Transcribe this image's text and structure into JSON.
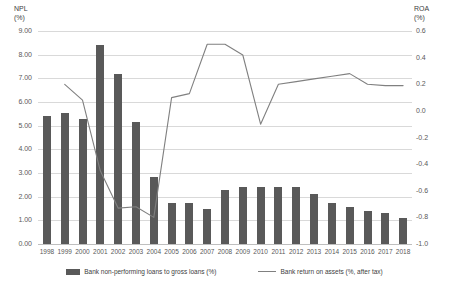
{
  "chart_data": {
    "type": "bar",
    "title": "",
    "xlabel": "",
    "ylabel": "NPL (%)",
    "y2label": "ROA (%)",
    "grid": true,
    "legend_position": "bottom",
    "categories": [
      "1998",
      "1999",
      "2000",
      "2001",
      "2002",
      "2003",
      "2004",
      "2005",
      "2006",
      "2007",
      "2008",
      "2009",
      "2010",
      "2011",
      "2012",
      "2013",
      "2014",
      "2015",
      "2016",
      "2017",
      "2018"
    ],
    "ylim": [
      0.0,
      9.0
    ],
    "y2lim": [
      -1.0,
      0.6
    ],
    "yticks": [
      "0.00",
      "1.00",
      "2.00",
      "3.00",
      "4.00",
      "5.00",
      "6.00",
      "7.00",
      "8.00",
      "9.00"
    ],
    "y2ticks": [
      "-1.0",
      "-0.8",
      "-0.6",
      "-0.4",
      "-0.2",
      "0.0",
      "0.2",
      "0.4",
      "0.6"
    ],
    "series": [
      {
        "name": "Bank non-performing loans to gross loans (%)",
        "axis": "left",
        "kind": "bar",
        "color": "#595959",
        "values": [
          5.4,
          5.55,
          5.3,
          8.4,
          7.2,
          5.15,
          2.85,
          1.75,
          1.75,
          1.5,
          2.3,
          2.4,
          2.4,
          2.4,
          2.4,
          2.1,
          1.75,
          1.55,
          1.4,
          1.3,
          1.1
        ]
      },
      {
        "name": "Bank return on assets (%, after tax)",
        "axis": "right",
        "kind": "line",
        "color": "#808080",
        "values": [
          null,
          0.2,
          0.08,
          -0.45,
          -0.73,
          -0.72,
          -0.8,
          0.1,
          0.13,
          0.5,
          0.5,
          0.42,
          -0.1,
          0.2,
          0.22,
          0.24,
          0.26,
          0.28,
          0.2,
          0.19,
          0.19
        ]
      }
    ]
  },
  "legend": {
    "items": [
      {
        "label": "Bank non-performing loans to gross loans (%)",
        "marker": "bar-swatch"
      },
      {
        "label": "Bank return on assets (%, after tax)",
        "marker": "line-swatch"
      }
    ]
  },
  "axes": {
    "left_title": "NPL\n(%)",
    "right_title": "ROA\n(%)"
  }
}
